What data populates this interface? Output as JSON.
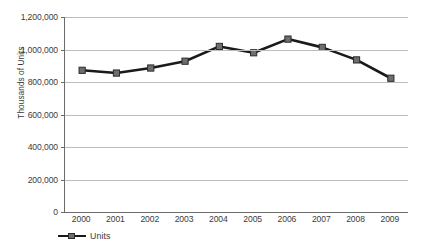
{
  "chart_data": {
    "type": "line",
    "title": "",
    "xlabel": "",
    "ylabel": "Thousands of Units",
    "ylim": [
      0,
      1200000
    ],
    "ytick_labels": [
      "1,200,000",
      "1,000,000",
      "800,000",
      "600,000",
      "400,000",
      "200,000",
      "0"
    ],
    "ytick_values": [
      1200000,
      1000000,
      800000,
      600000,
      400000,
      200000,
      0
    ],
    "grid": true,
    "legend_position": "bottom-left",
    "categories": [
      "2000",
      "2001",
      "2002",
      "2003",
      "2004",
      "2005",
      "2006",
      "2007",
      "2008",
      "2009"
    ],
    "series": [
      {
        "name": "Units",
        "values": [
          872000,
          855000,
          886000,
          928000,
          1019000,
          980000,
          1064000,
          1013000,
          936000,
          823000
        ],
        "line_color": "#1a1a1a",
        "marker_color": "#6e6e6e",
        "marker_edge_color": "#2b2b2b",
        "marker": "square"
      }
    ]
  },
  "axes": {
    "y_title": "Thousands of Units",
    "grid_color": "#bcbcbc",
    "axis_color": "#6b6b6b"
  },
  "legend": {
    "entries": [
      {
        "label": "Units"
      }
    ]
  },
  "title_sliver": ""
}
